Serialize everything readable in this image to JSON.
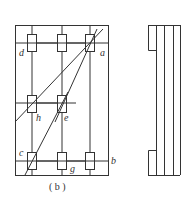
{
  "figure": {
    "caption": "( b )",
    "labels": {
      "a": "a",
      "b": "b",
      "c": "c",
      "d": "d",
      "e": "e",
      "g": "g",
      "h": "h"
    }
  },
  "colors": {
    "line": "#333333",
    "background": "#ffffff"
  }
}
